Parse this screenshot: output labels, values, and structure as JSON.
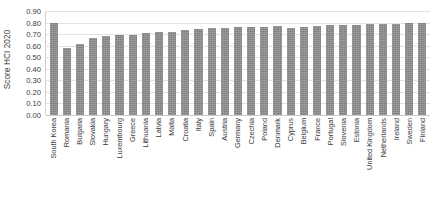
{
  "chart_data": {
    "type": "bar",
    "title": "",
    "xlabel": "",
    "ylabel": "Score HCI 2020",
    "ylim": [
      0.0,
      0.9
    ],
    "ytick_labels": [
      "0.90",
      "0.80",
      "0.70",
      "0.60",
      "0.50",
      "0.40",
      "0.30",
      "0.20",
      "0.10",
      "0.00"
    ],
    "ytick_values": [
      0.9,
      0.8,
      0.7,
      0.6,
      0.5,
      0.4,
      0.3,
      0.2,
      0.1,
      0.0
    ],
    "grid": true,
    "legend": null,
    "series_color": "#7f7f7f",
    "categories": [
      "South Korea",
      "Romania",
      "Bulgaria",
      "Slovakia",
      "Hungary",
      "Luxembourg",
      "Greece",
      "Lithuania",
      "Latvia",
      "Malta",
      "Croatia",
      "Italy",
      "Spain",
      "Austria",
      "Germany",
      "Czechia",
      "Poland",
      "Denmark",
      "Cyprus",
      "Belgium",
      "France",
      "Portugal",
      "Slovenia",
      "Estonia",
      "United Kingdom",
      "Netherlands",
      "Ireland",
      "Sweden",
      "Finland"
    ],
    "values": [
      0.8,
      0.58,
      0.615,
      0.665,
      0.685,
      0.69,
      0.695,
      0.71,
      0.715,
      0.72,
      0.735,
      0.745,
      0.755,
      0.755,
      0.76,
      0.765,
      0.765,
      0.77,
      0.755,
      0.765,
      0.77,
      0.775,
      0.775,
      0.78,
      0.785,
      0.79,
      0.79,
      0.795,
      0.795
    ]
  }
}
